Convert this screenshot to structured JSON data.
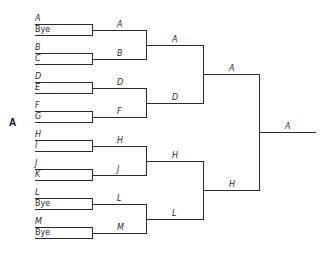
{
  "figure_label": "A",
  "bracket": {
    "rounds": [
      {
        "name": "round-1",
        "matches": [
          {
            "top": "A",
            "bottom": "Bye"
          },
          {
            "top": "B",
            "bottom": "C"
          },
          {
            "top": "D",
            "bottom": "E"
          },
          {
            "top": "F",
            "bottom": "G"
          },
          {
            "top": "H",
            "bottom": "I"
          },
          {
            "top": "J",
            "bottom": "K"
          },
          {
            "top": "L",
            "bottom": "Bye"
          },
          {
            "top": "M",
            "bottom": "Bye"
          }
        ]
      },
      {
        "name": "round-2",
        "winners": [
          "A",
          "B",
          "D",
          "F",
          "H",
          "J",
          "L",
          "M"
        ]
      },
      {
        "name": "round-3",
        "winners": [
          "A",
          "D",
          "H",
          "L"
        ]
      },
      {
        "name": "round-4",
        "winners": [
          "A",
          "H"
        ]
      },
      {
        "name": "final",
        "winners": [
          "A"
        ]
      }
    ]
  }
}
